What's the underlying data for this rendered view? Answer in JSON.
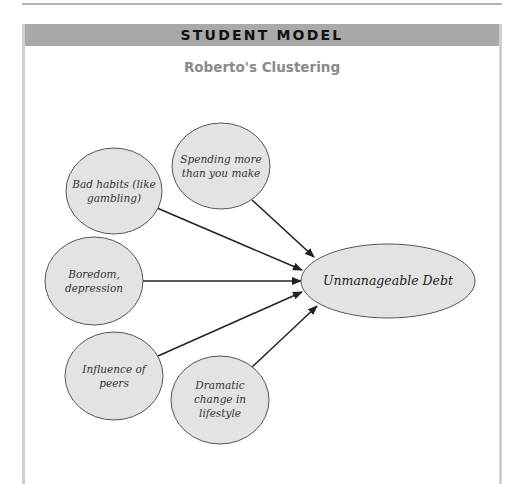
{
  "header": {
    "title": "STUDENT MODEL"
  },
  "subtitle": "Roberto's Clustering",
  "colors": {
    "header_bg": "#a9a9a9",
    "node_fill": "#e3e3e3",
    "node_stroke": "#555555",
    "arrow": "#222222",
    "subtitle": "#8a8a8a"
  },
  "diagram": {
    "central_node": {
      "label": "Unmanageable Debt"
    },
    "nodes": [
      {
        "id": "bad-habits",
        "lines": [
          "Bad habits (like",
          "gambling)"
        ]
      },
      {
        "id": "spending",
        "lines": [
          "Spending more",
          "than you make"
        ]
      },
      {
        "id": "boredom",
        "lines": [
          "Boredom,",
          "depression"
        ]
      },
      {
        "id": "peers",
        "lines": [
          "Influence of",
          "peers"
        ]
      },
      {
        "id": "lifestyle",
        "lines": [
          "Dramatic",
          "change in",
          "lifestyle"
        ]
      }
    ]
  }
}
